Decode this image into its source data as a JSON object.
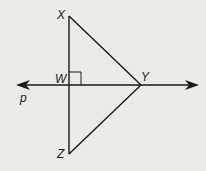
{
  "diagram": {
    "points": {
      "X": {
        "label": "X",
        "x": 69,
        "y": 16
      },
      "W": {
        "label": "W",
        "x": 69,
        "y": 85
      },
      "Y": {
        "label": "Y",
        "x": 141,
        "y": 85
      },
      "Z": {
        "label": "Z",
        "x": 69,
        "y": 154
      }
    },
    "line_label": "p",
    "segments": [
      "XZ",
      "XY",
      "YZ"
    ],
    "line": "p through W and Y",
    "right_angle_at": "W",
    "stroke_color": "#1a1a1a",
    "background_color": "#ebebe8"
  }
}
